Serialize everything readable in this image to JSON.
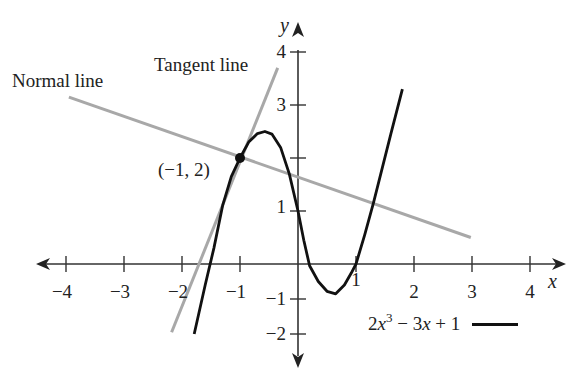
{
  "chart_data": {
    "type": "line",
    "title": "",
    "xlabel": "x",
    "ylabel": "y",
    "xlim": [
      -4.3,
      4.6
    ],
    "ylim": [
      -2.5,
      4.4
    ],
    "grid": false,
    "x_ticks": [
      -4,
      -3,
      -2,
      -1,
      1,
      2,
      3,
      4
    ],
    "x_tick_labels": [
      "−4",
      "−3",
      "−2",
      "−1",
      "1",
      "2",
      "3",
      "4"
    ],
    "y_ticks": [
      4,
      3,
      2,
      1,
      -1,
      -2
    ],
    "y_tick_labels": [
      "4",
      "3",
      "",
      "1",
      "−1",
      "−2"
    ],
    "series": [
      {
        "name": "2x^3 − 3x + 1",
        "role": "curve",
        "color": "#111111",
        "points": [
          [
            -1.79,
            -2.0
          ],
          [
            -1.6,
            -0.6
          ],
          [
            -1.45,
            0.3
          ],
          [
            -1.3,
            1.1
          ],
          [
            -1.15,
            1.65
          ],
          [
            -1.0,
            2.0
          ],
          [
            -0.85,
            2.3
          ],
          [
            -0.7,
            2.46
          ],
          [
            -0.57,
            2.5
          ],
          [
            -0.45,
            2.45
          ],
          [
            -0.3,
            2.2
          ],
          [
            -0.15,
            1.7
          ],
          [
            0.0,
            1.0
          ],
          [
            0.1,
            0.45
          ],
          [
            0.2,
            -0.05
          ],
          [
            0.35,
            -0.5
          ],
          [
            0.5,
            -0.78
          ],
          [
            0.65,
            -0.85
          ],
          [
            0.8,
            -0.6
          ],
          [
            0.92,
            -0.25
          ],
          [
            1.0,
            0.0
          ],
          [
            1.15,
            0.55
          ],
          [
            1.3,
            1.15
          ],
          [
            1.45,
            1.8
          ],
          [
            1.6,
            2.45
          ],
          [
            1.8,
            3.3
          ]
        ]
      },
      {
        "name": "Tangent line",
        "role": "tangent",
        "color": "#a8a8a8",
        "points": [
          [
            -2.18,
            -1.95
          ],
          [
            -0.35,
            3.7
          ]
        ]
      },
      {
        "name": "Normal line",
        "role": "normal",
        "color": "#a8a8a8",
        "points": [
          [
            -3.95,
            3.15
          ],
          [
            2.98,
            0.5
          ]
        ]
      }
    ],
    "highlight_point": {
      "x": -1,
      "y": 2,
      "label": "(−1, 2)"
    },
    "annotations": [
      {
        "text": "Normal line",
        "target": "normal"
      },
      {
        "text": "Tangent line",
        "target": "tangent"
      }
    ],
    "legend": {
      "position": "bottom-right",
      "entries": [
        {
          "label": "2x³ − 3x + 1",
          "style": "solid black line"
        }
      ]
    }
  },
  "labels": {
    "normal_line": "Normal line",
    "tangent_line": "Tangent line",
    "point": "(−1, 2)",
    "x_axis": "x",
    "y_axis": "y",
    "legend_coef": "2",
    "legend_var": "x",
    "legend_exp": "3",
    "legend_rest1": " − 3",
    "legend_var2": "x",
    "legend_rest2": " + 1"
  }
}
